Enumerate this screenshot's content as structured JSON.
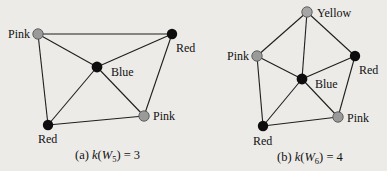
{
  "colors": {
    "background": "#ecebe8",
    "edge": "#1e1e1e",
    "node_gray": "#9a9a9a",
    "node_black": "#0d0d0d"
  },
  "figures": [
    {
      "id": "a",
      "caption_prefix": "(a) ",
      "caption_k": "k",
      "caption_open": "(",
      "caption_W": "W",
      "caption_sub": "5",
      "caption_close": ") = 3",
      "nodes": [
        {
          "id": "a1",
          "label": "Pink",
          "color": "gray",
          "x": 38,
          "y": 34
        },
        {
          "id": "a2",
          "label": "Red",
          "color": "black",
          "x": 172,
          "y": 34
        },
        {
          "id": "a3",
          "label": "Blue",
          "color": "black",
          "x": 97,
          "y": 67
        },
        {
          "id": "a4",
          "label": "Pink",
          "color": "gray",
          "x": 144,
          "y": 116
        },
        {
          "id": "a5",
          "label": "Red",
          "color": "black",
          "x": 48,
          "y": 125
        }
      ]
    },
    {
      "id": "b",
      "caption_prefix": "(b) ",
      "caption_k": "k",
      "caption_open": "(",
      "caption_W": "W",
      "caption_sub": "6",
      "caption_close": ") = 4",
      "nodes": [
        {
          "id": "b1",
          "label": "Yellow",
          "color": "gray",
          "x": 307,
          "y": 12
        },
        {
          "id": "b2",
          "label": "Pink",
          "color": "gray",
          "x": 257,
          "y": 56
        },
        {
          "id": "b3",
          "label": "Red",
          "color": "black",
          "x": 355,
          "y": 56
        },
        {
          "id": "b4",
          "label": "Blue",
          "color": "black",
          "x": 302,
          "y": 79
        },
        {
          "id": "b5",
          "label": "Pink",
          "color": "gray",
          "x": 338,
          "y": 117
        },
        {
          "id": "b6",
          "label": "Red",
          "color": "black",
          "x": 263,
          "y": 126
        }
      ]
    }
  ]
}
